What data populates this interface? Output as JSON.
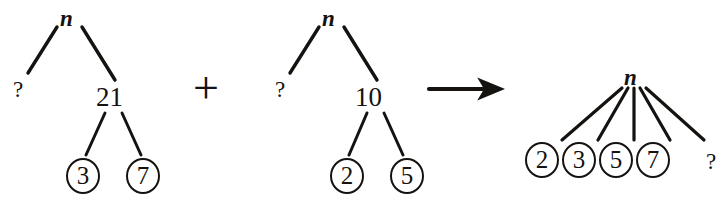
{
  "figure": {
    "stroke_color": "#15120f",
    "background_color": "#ffffff",
    "operators": {
      "plus": "+",
      "arrow": "arrow-right-icon"
    },
    "unknown_symbol": "?"
  },
  "trees": [
    {
      "id": "tree-left",
      "root_label": "n",
      "children": [
        {
          "label": "?",
          "circled": false
        },
        {
          "label": "21",
          "circled": false,
          "children": [
            {
              "label": "3",
              "circled": true
            },
            {
              "label": "7",
              "circled": true
            }
          ]
        }
      ]
    },
    {
      "id": "tree-middle",
      "root_label": "n",
      "children": [
        {
          "label": "?",
          "circled": false
        },
        {
          "label": "10",
          "circled": false,
          "children": [
            {
              "label": "2",
              "circled": true
            },
            {
              "label": "5",
              "circled": true
            }
          ]
        }
      ]
    },
    {
      "id": "tree-right",
      "root_label": "n",
      "children": [
        {
          "label": "2",
          "circled": true
        },
        {
          "label": "3",
          "circled": true
        },
        {
          "label": "5",
          "circled": true
        },
        {
          "label": "7",
          "circled": true
        },
        {
          "label": "?",
          "circled": false
        }
      ]
    }
  ],
  "left_tree": {
    "root": "n",
    "unknown": "?",
    "composite": "21",
    "leaf_a": "3",
    "leaf_b": "7"
  },
  "middle_tree": {
    "root": "n",
    "unknown": "?",
    "composite": "10",
    "leaf_a": "2",
    "leaf_b": "5"
  },
  "right_tree": {
    "root": "n",
    "leaf_1": "2",
    "leaf_2": "3",
    "leaf_3": "5",
    "leaf_4": "7",
    "unknown": "?"
  },
  "operators": {
    "plus": "+"
  }
}
